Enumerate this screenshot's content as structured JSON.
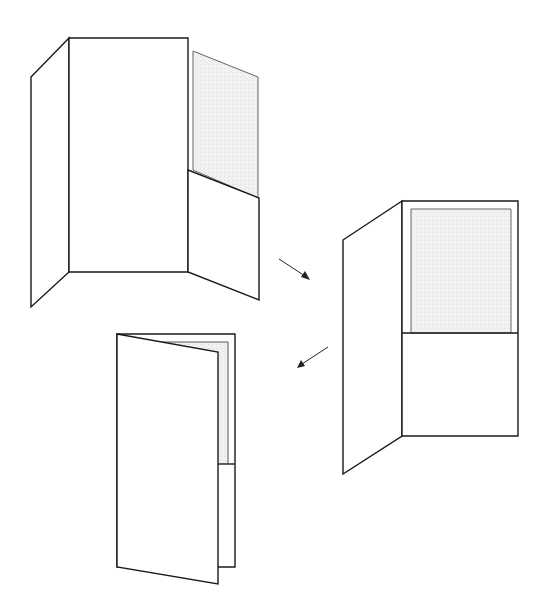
{
  "canvas": {
    "width": 551,
    "height": 615,
    "background": "#ffffff"
  },
  "colors": {
    "line": "#1a1a1a",
    "insert_fill": "#ececec",
    "insert_stroke": "#555555"
  },
  "figures": [
    {
      "id": "open-folder-trifold",
      "description": "Open presentation folder with left flap, center panel, and right panel with pocket holding an inserted sheet",
      "left_flap": "31,77 69,38 69,272 31,307",
      "center_panel": "69,38 188,38 188,272 69,272",
      "insert_sheet": "193,51 258,77 258,198 193,170",
      "pocket": "188,170 259,198 259,300 188,272"
    },
    {
      "id": "open-folder-front-view",
      "description": "Folder opened flat showing right panel with pocket and insert sheet",
      "left_flap": "343,240 402,201 402,436 343,474",
      "right_panel": "402,201 518,201 518,436 402,436",
      "insert_sheet": "411,209 511,209 511,333 411,333",
      "pocket_line": "402,333 518,333"
    },
    {
      "id": "closing-folder",
      "description": "Folder being closed with front cover partially over the back panel",
      "back_panel": "117,334 235,334 235,567 117,567",
      "insert_edge": "147,342 228,342 228,464",
      "pocket_line": "218,464 235,464",
      "front_cover": "117,334 218,352 218,584 117,567"
    }
  ],
  "arrows": [
    {
      "id": "arrow-1",
      "from": [
        279,
        259
      ],
      "to": [
        309,
        279
      ]
    },
    {
      "id": "arrow-2",
      "from": [
        328,
        347
      ],
      "to": [
        298,
        367
      ]
    }
  ]
}
